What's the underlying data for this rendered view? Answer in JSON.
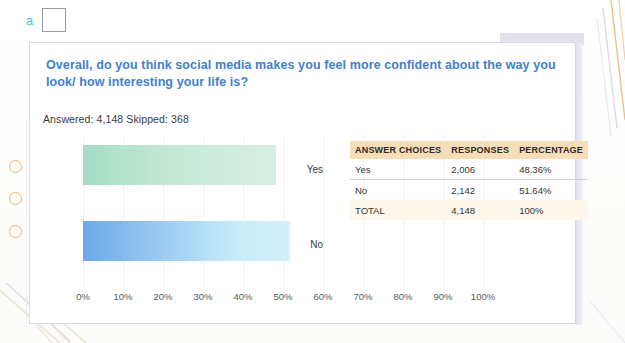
{
  "page": {
    "top_cut_text": "",
    "marker_letter": "a"
  },
  "survey": {
    "question": "Overall, do you think social media makes you feel more confident about the way you look/ how interesting your life is?",
    "answered_label": "Answered:",
    "answered_value": "4,148",
    "skipped_label": "Skipped:",
    "skipped_value": "368",
    "answered_line": "Answered: 4,148  Skipped: 368"
  },
  "table": {
    "headers": [
      "ANSWER CHOICES",
      "RESPONSES",
      "PERCENTAGE"
    ],
    "rows": [
      {
        "choice": "Yes",
        "responses": "2,006",
        "percentage": "48.36%"
      },
      {
        "choice": "No",
        "responses": "2,142",
        "percentage": "51.64%"
      },
      {
        "choice": "TOTAL",
        "responses": "4,148",
        "percentage": "100%"
      }
    ]
  },
  "colors": {
    "question_blue": "#3f7fd0",
    "table_header_tan": "#f7ddb8",
    "divider_orange": "#e0a35c",
    "bar_yes_green": "#a6ddc4",
    "bar_no_blue": "#6aa9e8",
    "binder_hole_orange": "#e8a55c",
    "letter_a_teal": "#4fc3d0"
  },
  "chart_data": {
    "type": "bar",
    "orientation": "horizontal",
    "title": "Overall, do you think social media makes you feel more confident about the way you look/ how interesting your life is?",
    "categories": [
      "Yes",
      "No"
    ],
    "values": [
      48.36,
      51.64
    ],
    "counts": [
      2006,
      2142
    ],
    "xlabel": "",
    "ylabel": "",
    "xlim": [
      0,
      100
    ],
    "xticks": [
      "0%",
      "10%",
      "20%",
      "30%",
      "40%",
      "50%",
      "60%",
      "70%",
      "80%",
      "90%",
      "100%"
    ],
    "xtick_values": [
      0,
      10,
      20,
      30,
      40,
      50,
      60,
      70,
      80,
      90,
      100
    ],
    "grid": true,
    "legend": false,
    "series_colors": [
      "#a6ddc4",
      "#6aa9e8"
    ],
    "total": 4148,
    "skipped": 368
  }
}
